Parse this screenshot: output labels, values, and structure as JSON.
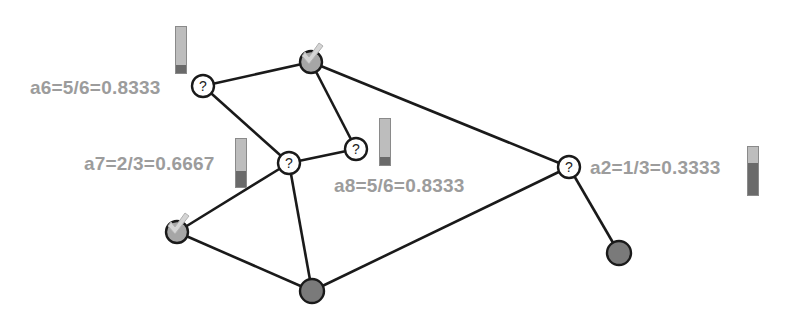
{
  "diagram": {
    "colors": {
      "edge": "#1a1a1a",
      "label": "#9c9c9c",
      "unknown_fill": "#ffffff",
      "known_fill": "#a6a6a6",
      "attacker_fill": "#7a7a7a",
      "gauge_light": "#bdbdbd",
      "gauge_dark": "#6a6a6a"
    },
    "nodes": [
      {
        "id": "a6",
        "type": "unknown",
        "symbol": "?",
        "x": 203,
        "y": 86
      },
      {
        "id": "top",
        "type": "checked",
        "x": 311,
        "y": 62
      },
      {
        "id": "a8",
        "type": "unknown",
        "symbol": "?",
        "x": 356,
        "y": 149
      },
      {
        "id": "a7",
        "type": "unknown",
        "symbol": "?",
        "x": 289,
        "y": 163
      },
      {
        "id": "a2",
        "type": "unknown",
        "symbol": "?",
        "x": 569,
        "y": 167
      },
      {
        "id": "left",
        "type": "checked",
        "x": 177,
        "y": 232
      },
      {
        "id": "bottom",
        "type": "dark",
        "x": 312,
        "y": 291
      },
      {
        "id": "right",
        "type": "dark",
        "x": 619,
        "y": 253
      }
    ],
    "edges": [
      [
        "a6",
        "top"
      ],
      [
        "a6",
        "a7"
      ],
      [
        "top",
        "a8"
      ],
      [
        "top",
        "a2"
      ],
      [
        "a8",
        "a7"
      ],
      [
        "a7",
        "left"
      ],
      [
        "a7",
        "bottom"
      ],
      [
        "left",
        "bottom"
      ],
      [
        "bottom",
        "a2"
      ],
      [
        "a2",
        "right"
      ]
    ],
    "labels": [
      {
        "node": "a6",
        "text": "a6=5/6=0.8333",
        "x": 30,
        "y": 78
      },
      {
        "node": "a7",
        "text": "a7=2/3=0.6667",
        "x": 84,
        "y": 154
      },
      {
        "node": "a8",
        "text": "a8=5/6=0.8333",
        "x": 334,
        "y": 176
      },
      {
        "node": "a2",
        "text": "a2=1/3=0.3333",
        "x": 590,
        "y": 158
      }
    ],
    "gauges": [
      {
        "node": "a6",
        "value": 0.8333,
        "x": 175,
        "y": 26,
        "height": 48
      },
      {
        "node": "a7",
        "value": 0.6667,
        "x": 235,
        "y": 138,
        "height": 50
      },
      {
        "node": "a8",
        "value": 0.8333,
        "x": 379,
        "y": 118,
        "height": 48
      },
      {
        "node": "a2",
        "value": 0.3333,
        "x": 747,
        "y": 146,
        "height": 50
      }
    ]
  }
}
